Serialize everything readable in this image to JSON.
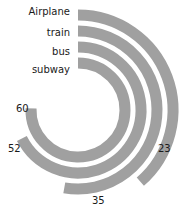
{
  "chart_data": {
    "type": "bar",
    "subtype": "radial-bar",
    "title": "",
    "xlabel": "",
    "ylabel": "",
    "categories": [
      "Airplane",
      "train",
      "bus",
      "subway"
    ],
    "values": [
      23,
      35,
      52,
      60
    ],
    "value_labels": [
      "23",
      "35",
      "52",
      "60"
    ],
    "series": [
      {
        "name": "value",
        "values": [
          23,
          35,
          52,
          60
        ]
      }
    ],
    "ylim": [
      0,
      100
    ],
    "grid": false,
    "legend": "none",
    "start_angle_deg": 0,
    "direction": "clockwise",
    "bar_color": "#a0a0a0",
    "track_color": "#ffffff",
    "background": "#ffffff",
    "text_color": "#1a1a1a"
  },
  "chart": {
    "center": {
      "x": 78,
      "y": 110
    },
    "rings": [
      {
        "category": "Airplane",
        "value": 23,
        "value_text": "23",
        "radius": 95,
        "thickness": 11,
        "sweep_deg": 139,
        "cat_label_pos": {
          "x": 8,
          "y": 7,
          "width": 62
        },
        "val_label_pos": {
          "x": 158,
          "y": 144
        }
      },
      {
        "category": "train",
        "value": 35,
        "value_text": "35",
        "radius": 79,
        "thickness": 11,
        "sweep_deg": 190,
        "cat_label_pos": {
          "x": 8,
          "y": 28,
          "width": 62
        },
        "val_label_pos": {
          "x": 92,
          "y": 196
        }
      },
      {
        "category": "bus",
        "value": 52,
        "value_text": "52",
        "radius": 63,
        "thickness": 11,
        "sweep_deg": 243,
        "cat_label_pos": {
          "x": 8,
          "y": 47,
          "width": 62
        },
        "val_label_pos": {
          "x": 8,
          "y": 144
        }
      },
      {
        "category": "subway",
        "value": 60,
        "value_text": "60",
        "radius": 47,
        "thickness": 11,
        "sweep_deg": 272,
        "cat_label_pos": {
          "x": 8,
          "y": 65,
          "width": 62
        },
        "val_label_pos": {
          "x": 16,
          "y": 104
        }
      }
    ]
  }
}
